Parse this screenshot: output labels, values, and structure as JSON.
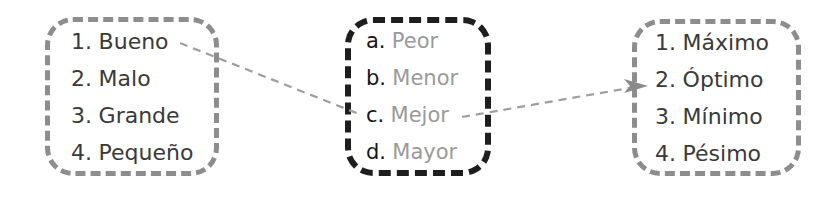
{
  "diagram": {
    "boxes": [
      {
        "id": "left",
        "border_color": "#8d8d8d",
        "border_style": "dashed",
        "items": [
          {
            "marker": "1.",
            "label": "Bueno"
          },
          {
            "marker": "2.",
            "label": "Malo"
          },
          {
            "marker": "3.",
            "label": "Grande"
          },
          {
            "marker": "4.",
            "label": "Pequeño"
          }
        ]
      },
      {
        "id": "middle",
        "border_color": "#1e1e1e",
        "border_style": "dashed",
        "items": [
          {
            "marker": "a.",
            "label": "Peor"
          },
          {
            "marker": "b.",
            "label": "Menor"
          },
          {
            "marker": "c.",
            "label": "Mejor"
          },
          {
            "marker": "d.",
            "label": "Mayor"
          }
        ]
      },
      {
        "id": "right",
        "border_color": "#8d8d8d",
        "border_style": "dashed",
        "items": [
          {
            "marker": "1.",
            "label": "Máximo"
          },
          {
            "marker": "2.",
            "label": "Óptimo"
          },
          {
            "marker": "3.",
            "label": "Mínimo"
          },
          {
            "marker": "4.",
            "label": "Pésimo"
          }
        ]
      }
    ],
    "connectors": [
      {
        "id": "bueno-to-mejor",
        "from": "1. Bueno",
        "to": "c. Mejor",
        "style": "dashed",
        "color": "#9e9e9e",
        "arrow": false
      },
      {
        "id": "mejor-to-optimo",
        "from": "c. Mejor",
        "to": "2. Óptimo",
        "style": "dashed",
        "color": "#9e9e9e",
        "arrow": true
      }
    ]
  }
}
